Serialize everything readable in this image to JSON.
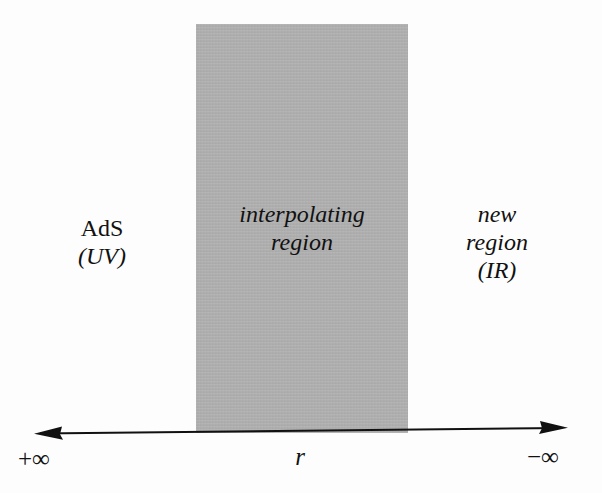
{
  "figure": {
    "type": "holographic-flow-diagram",
    "background_color": "#fdfdfd",
    "band_color": "#b2b2b2",
    "text_color": "#111111"
  },
  "regions": {
    "left": {
      "name_label": "AdS",
      "scale_label": "(UV)"
    },
    "middle": {
      "name_line1": "interpolating",
      "name_line2": "region"
    },
    "right": {
      "name_line1": "new",
      "name_line2": "region",
      "scale_label": "(IR)"
    }
  },
  "axis": {
    "variable": "r",
    "left_endpoint": "+∞",
    "right_endpoint": "−∞",
    "direction": "bidirectional"
  }
}
